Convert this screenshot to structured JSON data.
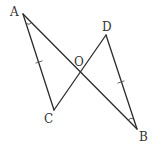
{
  "diagram": {
    "type": "geometry",
    "colors": {
      "line": "#2b2b2b",
      "label": "#333333",
      "background": "#ffffff"
    },
    "points": [
      {
        "name": "A",
        "x": 23,
        "y": 14,
        "label": "A",
        "label_x": 10,
        "label_y": 16
      },
      {
        "name": "D",
        "x": 106,
        "y": 35,
        "label": "D",
        "label_x": 102,
        "label_y": 31
      },
      {
        "name": "O",
        "x": 80,
        "y": 72,
        "label": "O",
        "label_x": 74,
        "label_y": 66
      },
      {
        "name": "C",
        "x": 54,
        "y": 110,
        "label": "C",
        "label_x": 44,
        "label_y": 123
      },
      {
        "name": "B",
        "x": 137,
        "y": 129,
        "label": "B",
        "label_x": 139,
        "label_y": 141
      }
    ],
    "segments": [
      {
        "from": "A",
        "to": "B"
      },
      {
        "from": "A",
        "to": "C"
      },
      {
        "from": "C",
        "to": "D"
      },
      {
        "from": "D",
        "to": "B"
      }
    ],
    "equal_marks": [
      {
        "segment": "AC",
        "x": 39,
        "y": 62
      },
      {
        "segment": "DB",
        "x": 121,
        "y": 82
      }
    ],
    "angle_marks": [
      {
        "vertex": "A",
        "between": [
          "C",
          "B"
        ]
      },
      {
        "vertex": "B",
        "between": [
          "A",
          "D"
        ]
      }
    ]
  }
}
